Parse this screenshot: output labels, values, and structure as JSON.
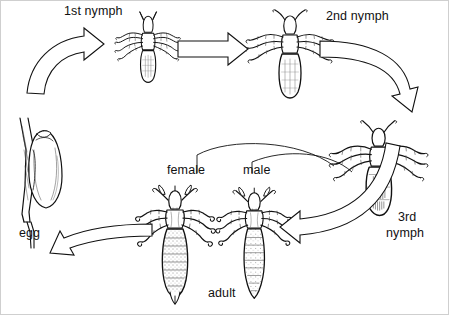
{
  "diagram": {
    "background_color": "#ffffff",
    "ink_color": "#111111",
    "stages": [
      {
        "id": "egg",
        "label": "egg",
        "label_line1": "egg",
        "label_line2": ""
      },
      {
        "id": "nymph1",
        "label": "1st nymph",
        "label_line1": "1st nymph",
        "label_line2": ""
      },
      {
        "id": "nymph2",
        "label": "2nd nymph",
        "label_line1": "2nd nymph",
        "label_line2": ""
      },
      {
        "id": "nymph3",
        "label": "3rd nymph",
        "label_line1": "3rd",
        "label_line2": "nymph"
      },
      {
        "id": "adult",
        "label": "adult",
        "label_line1": "adult",
        "label_line2": ""
      }
    ],
    "sub_labels": [
      {
        "id": "female",
        "label": "female"
      },
      {
        "id": "male",
        "label": "male"
      }
    ],
    "labels": {
      "nymph1": "1st nymph",
      "nymph2": "2nd nymph",
      "nymph3_line1": "3rd",
      "nymph3_line2": "nymph",
      "egg": "egg",
      "adult": "adult",
      "female": "female",
      "male": "male"
    },
    "arrows": [
      {
        "id": "egg-to-nymph1",
        "from": "egg",
        "to": "nymph1",
        "style": "curved-block",
        "direction": "up-right"
      },
      {
        "id": "nymph1-to-nymph2",
        "from": "nymph1",
        "to": "nymph2",
        "style": "straight-block",
        "direction": "right"
      },
      {
        "id": "nymph2-to-nymph3",
        "from": "nymph2",
        "to": "nymph3",
        "style": "curved-block",
        "direction": "right-down"
      },
      {
        "id": "nymph3-to-adult",
        "from": "nymph3",
        "to": "adult",
        "style": "curved-block",
        "direction": "left"
      },
      {
        "id": "adult-to-egg",
        "from": "adult",
        "to": "egg",
        "style": "curved-block",
        "direction": "left"
      }
    ],
    "leaders": [
      {
        "id": "female-leader",
        "target": "female"
      },
      {
        "id": "male-leader",
        "target": "male"
      }
    ]
  }
}
